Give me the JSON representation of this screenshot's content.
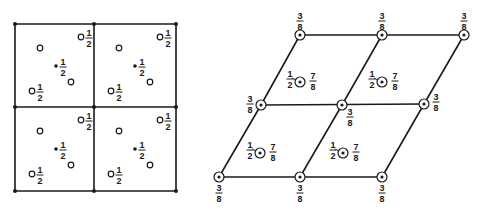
{
  "colors": {
    "ink": "#1a1a1a",
    "background": "#ffffff"
  },
  "left_diagram": {
    "kind": "square-cell-projection",
    "grid": {
      "xs": [
        15,
        94,
        176
      ],
      "ys": [
        24,
        107,
        191
      ]
    },
    "cell_origins": [
      [
        15,
        24
      ],
      [
        94,
        24
      ],
      [
        15,
        107
      ],
      [
        94,
        107
      ]
    ],
    "cell_motif": [
      {
        "type": "open-circle",
        "dx": 25,
        "dy": 24,
        "label": ""
      },
      {
        "type": "open-circle",
        "dx": 66,
        "dy": 13,
        "label": "1/2",
        "label_dx": 8
      },
      {
        "type": "dot",
        "dx": 41,
        "dy": 42,
        "label": "1/2",
        "label_dx": 7
      },
      {
        "type": "open-circle",
        "dx": 56,
        "dy": 58,
        "label": ""
      },
      {
        "type": "open-circle",
        "dx": 17,
        "dy": 67,
        "label": "1/2",
        "label_dx": 8
      }
    ],
    "fraction_label": {
      "num": "1",
      "den": "2"
    }
  },
  "right_diagram": {
    "kind": "oblique-cell-projection",
    "lattice_points": [
      {
        "x": 300,
        "y": 35,
        "num": "3",
        "den": "8",
        "pos": "above"
      },
      {
        "x": 382,
        "y": 35,
        "num": "3",
        "den": "8",
        "pos": "above"
      },
      {
        "x": 464,
        "y": 35,
        "num": "3",
        "den": "8",
        "pos": "above"
      },
      {
        "x": 261,
        "y": 105,
        "num": "3",
        "den": "8",
        "pos": "left"
      },
      {
        "x": 342,
        "y": 105,
        "num": "3",
        "den": "8",
        "pos": "below-right"
      },
      {
        "x": 424,
        "y": 104,
        "num": "3",
        "den": "8",
        "pos": "right"
      },
      {
        "x": 219,
        "y": 177,
        "num": "3",
        "den": "8",
        "pos": "below"
      },
      {
        "x": 300,
        "y": 177,
        "num": "3",
        "den": "8",
        "pos": "below"
      },
      {
        "x": 382,
        "y": 177,
        "num": "3",
        "den": "8",
        "pos": "below"
      }
    ],
    "interior_points": [
      {
        "x": 300,
        "y": 82,
        "left": {
          "num": "1",
          "den": "2"
        },
        "right": {
          "num": "7",
          "den": "8"
        }
      },
      {
        "x": 382,
        "y": 82,
        "left": {
          "num": "1",
          "den": "2"
        },
        "right": {
          "num": "7",
          "den": "8"
        }
      },
      {
        "x": 260,
        "y": 153,
        "left": {
          "num": "1",
          "den": "2"
        },
        "right": {
          "num": "7",
          "den": "8"
        }
      },
      {
        "x": 343,
        "y": 153,
        "left": {
          "num": "1",
          "den": "2"
        },
        "right": {
          "num": "7",
          "den": "8"
        }
      }
    ]
  }
}
